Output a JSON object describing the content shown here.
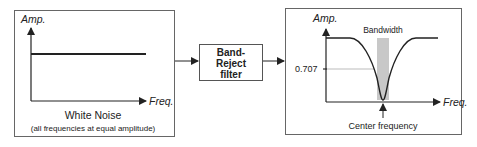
{
  "input_panel": {
    "y_axis_label": "Amp.",
    "x_axis_label": "Freq.",
    "title": "White Noise",
    "subtitle": "(all frequencies at equal amplitude)"
  },
  "filter_block": {
    "line1": "Band-",
    "line2": "Reject",
    "line3": "filter"
  },
  "output_panel": {
    "y_axis_label": "Amp.",
    "x_axis_label": "Freq.",
    "bandwidth_label": "Bandwidth",
    "level_label": "0.707",
    "center_label": "Center frequency"
  },
  "colors": {
    "stroke": "#222222",
    "box_border": "#555555",
    "band_fill": "#c8c8c8",
    "guide_line": "#aaaaaa"
  }
}
